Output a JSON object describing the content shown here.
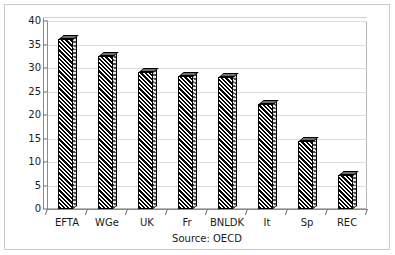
{
  "chart_data": {
    "type": "bar",
    "title": "",
    "subtitle": "",
    "xlabel": "",
    "ylabel": "",
    "source_note": "Source: OECD",
    "categories": [
      "EFTA",
      "WGe",
      "UK",
      "Fr",
      "BNLDK",
      "It",
      "Sp",
      "REC"
    ],
    "values": [
      36.2,
      32.6,
      29.2,
      28.4,
      28.0,
      22.3,
      14.4,
      7.2
    ],
    "series": [
      {
        "name": "",
        "values": [
          36.2,
          32.6,
          29.2,
          28.4,
          28.0,
          22.3,
          14.4,
          7.2
        ]
      }
    ],
    "ylim": [
      0,
      40
    ],
    "ytick_labels": [
      "0",
      "5",
      "10",
      "15",
      "20",
      "25",
      "30",
      "35",
      "40"
    ],
    "ytick_values": [
      0,
      5,
      10,
      15,
      20,
      25,
      30,
      35,
      40
    ],
    "grid": true,
    "grid_axis": "y",
    "legend": false,
    "legend_position": "none",
    "bar_style": "diagonal-hatch-3d",
    "colors": {
      "bar_fill": "#000000",
      "bar_background": "#ffffff",
      "bar_side": "#4d4d4d",
      "bar_top": "#6e6e6e",
      "gridline": "#dcdcdc",
      "axis": "#8a8a8a",
      "frame": "#c9c9c9",
      "text": "#1a1a1a",
      "plot_background": "#ffffff"
    }
  }
}
